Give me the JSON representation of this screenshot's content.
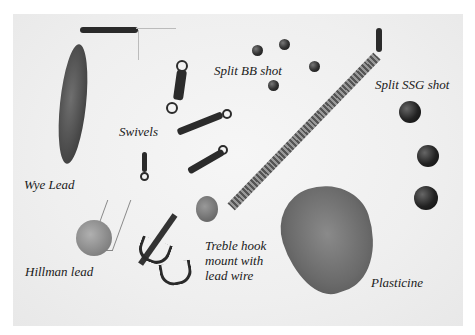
{
  "image": {
    "description": "Photograph of fishing tackle items on a white background with italic labels",
    "background_color": "#f2f2f2"
  },
  "labels": {
    "wye_lead": "Wye Lead",
    "swivels": "Swivels",
    "split_bb_shot": "Split BB shot",
    "split_ssg_shot": "Split SSG shot",
    "hillman_lead": "Hillman lead",
    "treble_hook": "Treble hook\nmount with\nlead wire",
    "plasticine": "Plasticine"
  }
}
